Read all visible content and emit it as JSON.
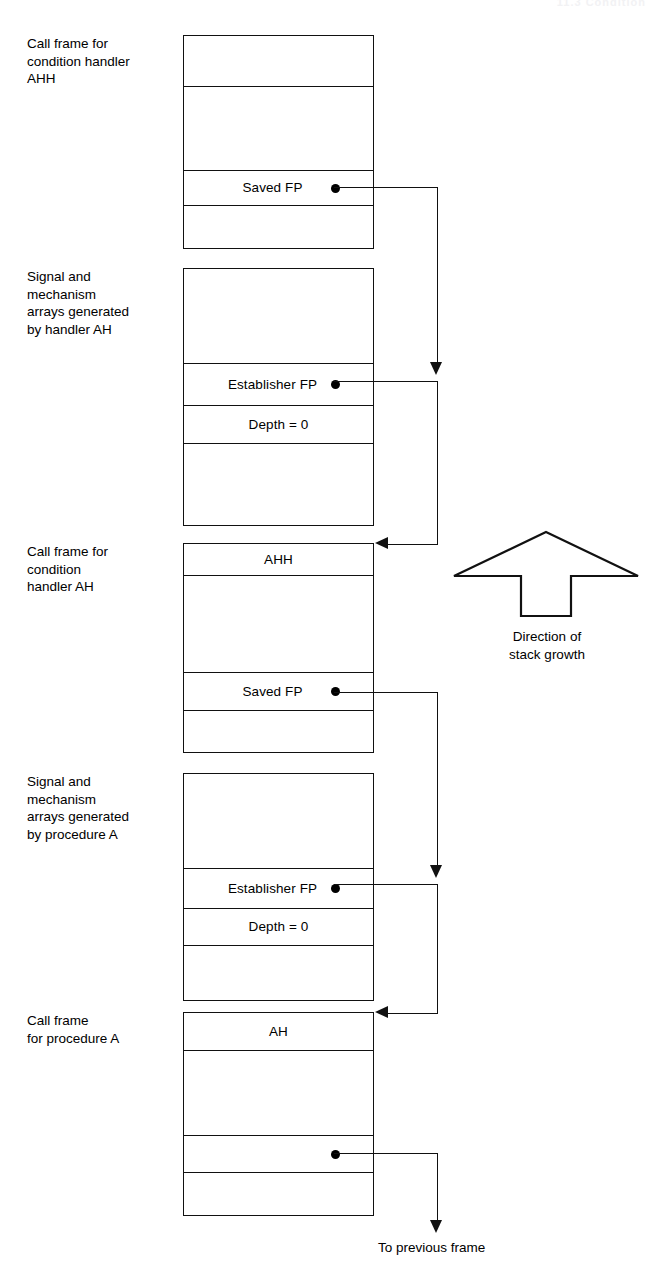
{
  "page": {
    "header_faint": "11.3  Condition",
    "width": 670,
    "height": 1280,
    "ink_color": "#111111",
    "background": "#ffffff"
  },
  "diagram": {
    "direction_arrow": {
      "caption": "Direction of\nstack growth",
      "points": "up"
    },
    "bottom_pointer_label": "To previous frame",
    "blocks": [
      {
        "id": "call-frame-ahh",
        "side_label": "Call frame for\ncondition handler\nAHH",
        "cells": [
          {
            "text": "",
            "dot": false
          },
          {
            "text": "",
            "dot": false
          },
          {
            "text": "Saved FP",
            "dot": true
          },
          {
            "text": "",
            "dot": false
          }
        ]
      },
      {
        "id": "signal-mechanism-ah",
        "side_label": "Signal and\nmechanism\narrays generated\nby handler AH",
        "cells": [
          {
            "text": "",
            "dot": false
          },
          {
            "text": "Establisher FP",
            "dot": true
          },
          {
            "text": "Depth = 0",
            "dot": false
          },
          {
            "text": "",
            "dot": false
          }
        ]
      },
      {
        "id": "call-frame-ah",
        "side_label": "Call frame for\ncondition\nhandler AH",
        "cells": [
          {
            "text": "AHH",
            "dot": false
          },
          {
            "text": "",
            "dot": false
          },
          {
            "text": "Saved FP",
            "dot": true
          },
          {
            "text": "",
            "dot": false
          }
        ]
      },
      {
        "id": "signal-mechanism-a",
        "side_label": "Signal and\nmechanism\narrays generated\nby procedure A",
        "cells": [
          {
            "text": "",
            "dot": false
          },
          {
            "text": "Establisher FP",
            "dot": true
          },
          {
            "text": "Depth = 0",
            "dot": false
          },
          {
            "text": "",
            "dot": false
          }
        ]
      },
      {
        "id": "call-frame-a",
        "side_label": "Call frame\nfor procedure A",
        "cells": [
          {
            "text": "AH",
            "dot": false
          },
          {
            "text": "",
            "dot": false
          },
          {
            "text": "",
            "dot": true
          },
          {
            "text": "",
            "dot": false
          }
        ]
      }
    ]
  }
}
